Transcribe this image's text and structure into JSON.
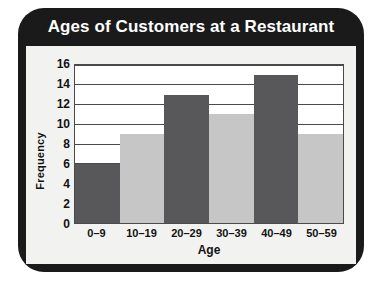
{
  "chart_data": {
    "type": "bar",
    "title": "Ages of Customers at a Restaurant",
    "xlabel": "Age",
    "ylabel": "Frequency",
    "categories": [
      "0–9",
      "10–19",
      "20–29",
      "30–39",
      "40–49",
      "50–59"
    ],
    "values": [
      6,
      9,
      13,
      11,
      15,
      9
    ],
    "bar_colors": [
      "#58585a",
      "#c6c6c6",
      "#58585a",
      "#c6c6c6",
      "#58585a",
      "#c6c6c6"
    ],
    "ylim": [
      0,
      16
    ],
    "yticks": [
      0,
      2,
      4,
      6,
      8,
      10,
      12,
      14,
      16
    ],
    "gridlines": [
      2,
      4,
      6,
      8,
      10,
      12,
      14,
      16
    ],
    "grid": true,
    "legend": null
  },
  "style": {
    "frame_color": "#1a1a1a",
    "panel_color": "#f2f2f0",
    "plot_background": "#ffffff",
    "axis_color": "#4a4a4a",
    "title_color": "#ffffff",
    "text_color": "#121212"
  }
}
